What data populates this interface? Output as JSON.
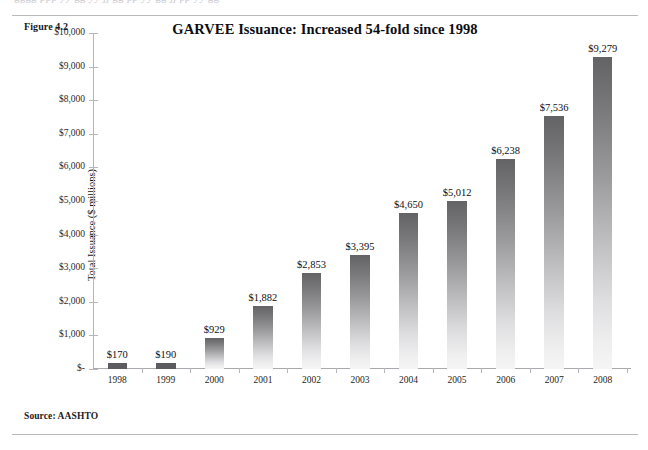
{
  "scan": {
    "top_clipped_line": "gggg ppp yy gg yy jj gg pp yy gg jj pp yy gg"
  },
  "figure": {
    "label": "Figure 4.2",
    "source": "Source: AASHTO"
  },
  "chart_data": {
    "type": "bar",
    "title": "GARVEE Issuance: Increased 54-fold since 1998",
    "xlabel": "",
    "ylabel": "Total Issuance ($ millions)",
    "categories": [
      "1998",
      "1999",
      "2000",
      "2001",
      "2002",
      "2003",
      "2004",
      "2005",
      "2006",
      "2007",
      "2008"
    ],
    "values": [
      170,
      190,
      929,
      1882,
      2853,
      3395,
      4650,
      5012,
      6238,
      7536,
      9279
    ],
    "value_labels": [
      "$170",
      "$190",
      "$929",
      "$1,882",
      "$2,853",
      "$3,395",
      "$4,650",
      "$5,012",
      "$6,238",
      "$7,536",
      "$9,279"
    ],
    "ylim": [
      0,
      10000
    ],
    "ytick_values": [
      10000,
      9000,
      8000,
      7000,
      6000,
      5000,
      4000,
      3000,
      2000,
      1000,
      0
    ],
    "ytick_labels": [
      "$10,000",
      "$9,000",
      "$8,000",
      "$7,000",
      "$6,000",
      "$5,000",
      "$4,000",
      "$3,000",
      "$2,000",
      "$1,000",
      "$-"
    ],
    "grid": false,
    "legend": "none",
    "bar_color_top": "#636366",
    "bar_color_bottom": "#f5f5f6",
    "axis_color": "#b5b5ba"
  }
}
